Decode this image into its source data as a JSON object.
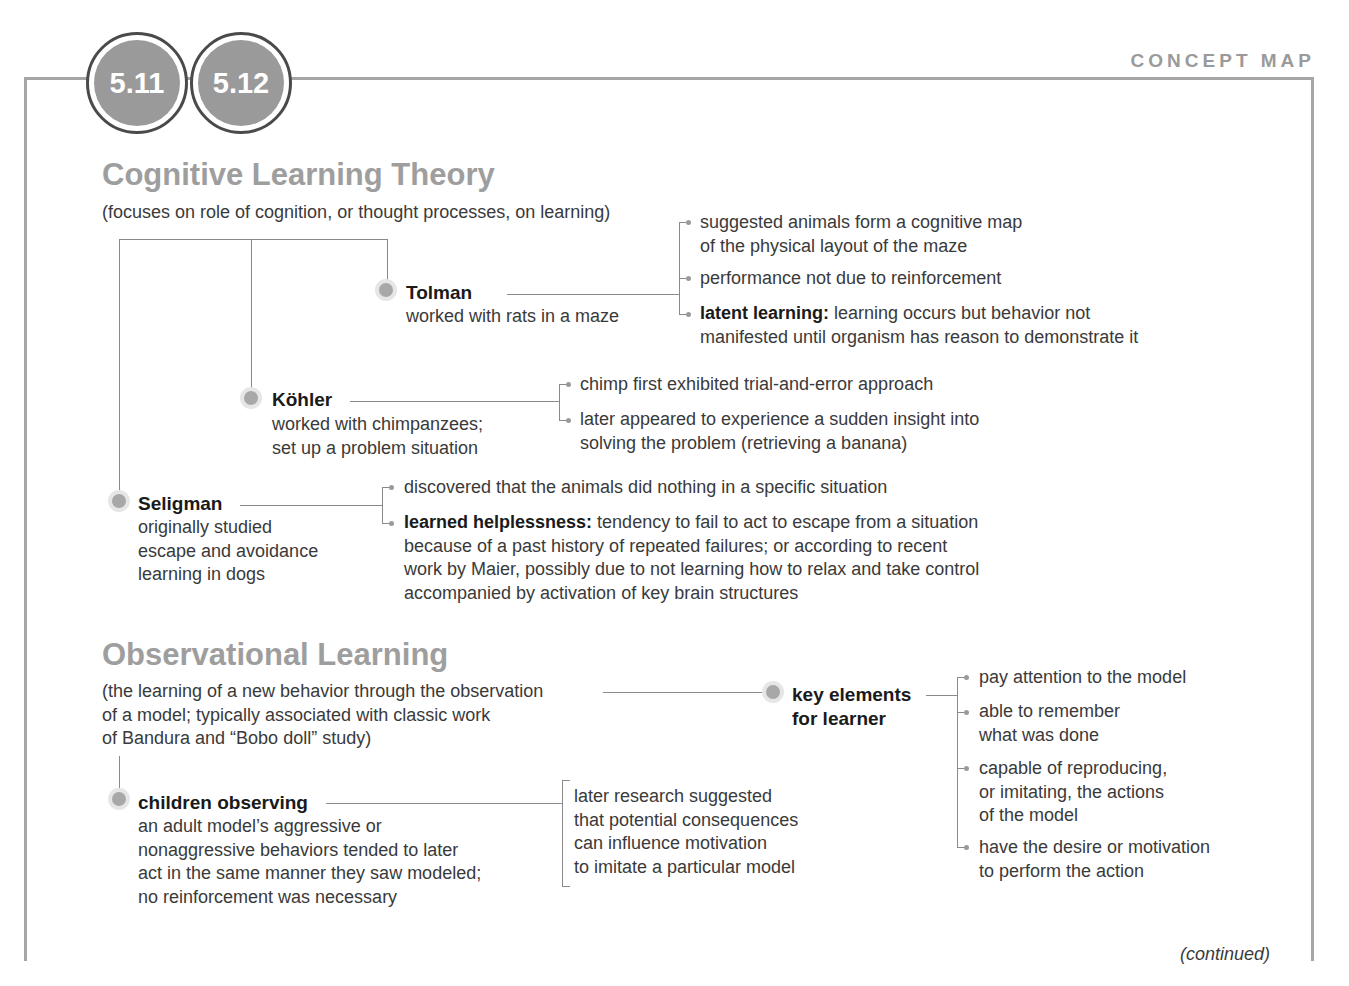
{
  "header": {
    "top_cutoff_text": "...mainly about the cognitive and...",
    "badges": [
      "5.11",
      "5.12"
    ],
    "label": "CONCEPT MAP"
  },
  "cognitive": {
    "title": "Cognitive Learning Theory",
    "subtitle": "(focuses on role of cognition, or thought processes, on learning)",
    "tolman": {
      "name": "Tolman",
      "desc": "worked with rats in a maze",
      "points": [
        {
          "lines": [
            "suggested animals form a cognitive map",
            "of the physical layout of the maze"
          ]
        },
        {
          "lines": [
            "performance not due to reinforcement"
          ]
        },
        {
          "term": "latent learning:",
          "lines": [
            " learning occurs but behavior not",
            "manifested until organism has reason to demonstrate it"
          ]
        }
      ]
    },
    "kohler": {
      "name": "Köhler",
      "desc": [
        "worked with chimpanzees;",
        "set up a problem situation"
      ],
      "points": [
        {
          "lines": [
            "chimp first exhibited trial-and-error approach"
          ]
        },
        {
          "lines": [
            "later appeared to experience a sudden insight into",
            "solving the problem (retrieving a banana)"
          ]
        }
      ]
    },
    "seligman": {
      "name": "Seligman",
      "desc": [
        "originally studied",
        "escape and avoidance",
        "learning in dogs"
      ],
      "points": [
        {
          "lines": [
            "discovered that the animals did nothing in a specific situation"
          ]
        },
        {
          "term": "learned helplessness:",
          "lines": [
            " tendency to fail to act to escape from a situation",
            "because of a past history of repeated failures; or according to recent",
            "work by Maier, possibly due to not learning how to relax and take control",
            "accompanied by activation of key brain structures"
          ]
        }
      ]
    }
  },
  "observational": {
    "title": "Observational Learning",
    "subtitle": [
      "(the learning of a new behavior through the observation",
      "of a model; typically associated with classic work",
      "of Bandura and “Bobo doll” study)"
    ],
    "key_elements": {
      "name": [
        "key elements",
        "for learner"
      ],
      "points": [
        {
          "lines": [
            "pay attention to the model"
          ]
        },
        {
          "lines": [
            "able to remember",
            "what was done"
          ]
        },
        {
          "lines": [
            "capable of reproducing,",
            "or imitating, the actions",
            "of the model"
          ]
        },
        {
          "lines": [
            "have the desire or motivation",
            "to perform the action"
          ]
        }
      ]
    },
    "children": {
      "name": "children observing",
      "desc": [
        "an adult model’s aggressive or",
        "nonaggressive behaviors tended to later",
        "act in the same manner they saw modeled;",
        "no reinforcement was necessary"
      ],
      "note": [
        "later research suggested",
        "that potential consequences",
        "can influence motivation",
        "to imitate a particular model"
      ]
    }
  },
  "footer": {
    "continued": "(continued)"
  }
}
